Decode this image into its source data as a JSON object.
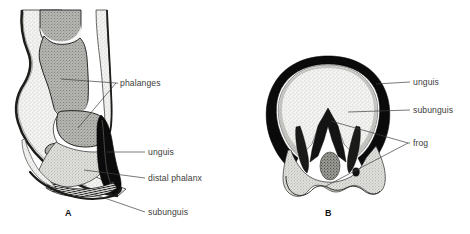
{
  "figure": {
    "background_color": "#ffffff",
    "ink_color": "#3f3f3f",
    "panels": [
      {
        "id": "A",
        "panel_label": "A",
        "view": "sagittal-section-of-ungulate-foot",
        "labels": [
          {
            "key": "phalanges",
            "text": "phalanges",
            "x": 120,
            "y": 85
          },
          {
            "key": "unguis",
            "text": "unguis",
            "x": 148,
            "y": 155
          },
          {
            "key": "distal_phalanx",
            "text": "distal phalanx",
            "x": 148,
            "y": 181
          },
          {
            "key": "subunguis",
            "text": "subunguis",
            "x": 148,
            "y": 215
          }
        ]
      },
      {
        "id": "B",
        "panel_label": "B",
        "view": "transverse-section-of-hoof-sole",
        "labels": [
          {
            "key": "unguis",
            "text": "unguis",
            "x": 413,
            "y": 85
          },
          {
            "key": "subunguis",
            "text": "subunguis",
            "x": 413,
            "y": 113
          },
          {
            "key": "frog",
            "text": "frog",
            "x": 413,
            "y": 146
          }
        ]
      }
    ],
    "colors": {
      "keratin_wall": "#0d0d0d",
      "bone_fill": "#8e8e8e",
      "soft_tissue_fill": "#ececec",
      "stipple_fill": "#c9c9c9",
      "outline": "#1a1a1a",
      "text": "#3c3c3c",
      "leader_line": "#3f3f3f"
    }
  }
}
